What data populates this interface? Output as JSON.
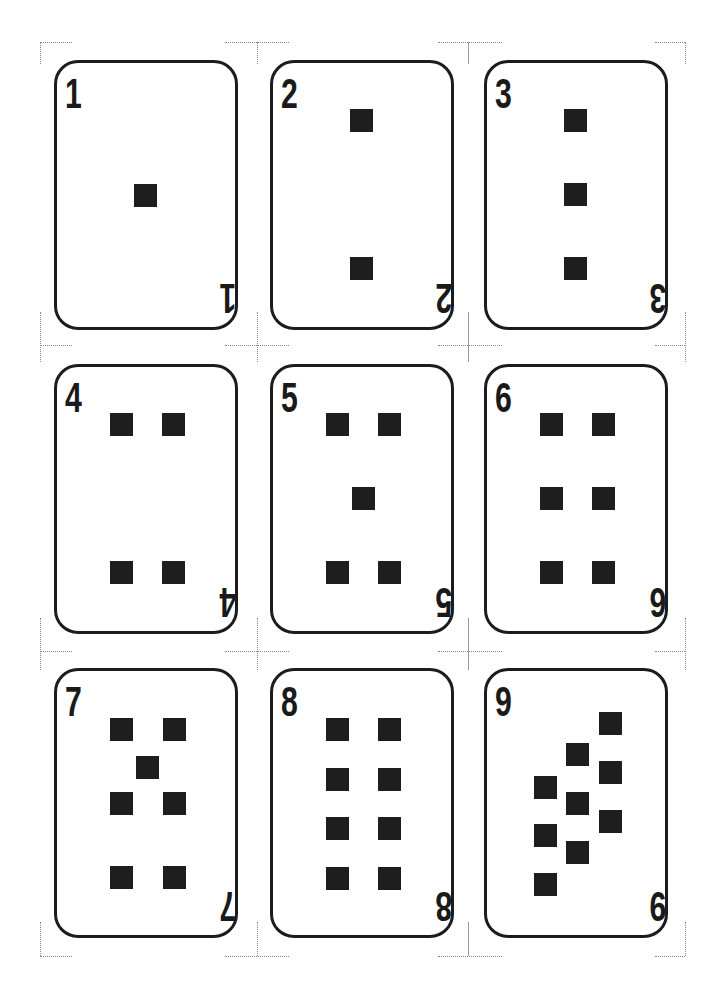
{
  "sheet": {
    "background": "#ffffff",
    "ink_color": "#1e1e1e",
    "pip_shape": "square",
    "layout": {
      "columns": 3,
      "rows": 3
    }
  },
  "cards": [
    {
      "rank": "1",
      "pips": [
        [
          91,
          135
        ]
      ]
    },
    {
      "rank": "2",
      "pips": [
        [
          91,
          60
        ],
        [
          91,
          208
        ]
      ]
    },
    {
      "rank": "3",
      "pips": [
        [
          91,
          60
        ],
        [
          91,
          134
        ],
        [
          91,
          208
        ]
      ]
    },
    {
      "rank": "4",
      "pips": [
        [
          67,
          60
        ],
        [
          119,
          60
        ],
        [
          67,
          208
        ],
        [
          119,
          208
        ]
      ]
    },
    {
      "rank": "5",
      "pips": [
        [
          67,
          60
        ],
        [
          119,
          60
        ],
        [
          93,
          134
        ],
        [
          67,
          208
        ],
        [
          119,
          208
        ]
      ]
    },
    {
      "rank": "6",
      "pips": [
        [
          67,
          60
        ],
        [
          119,
          60
        ],
        [
          67,
          134
        ],
        [
          119,
          134
        ],
        [
          67,
          208
        ],
        [
          119,
          208
        ]
      ]
    },
    {
      "rank": "7",
      "pips": [
        [
          67,
          61
        ],
        [
          120,
          61
        ],
        [
          93,
          99
        ],
        [
          67,
          135
        ],
        [
          120,
          135
        ],
        [
          67,
          209
        ],
        [
          120,
          209
        ]
      ]
    },
    {
      "rank": "8",
      "pips": [
        [
          67,
          61
        ],
        [
          119,
          61
        ],
        [
          67,
          111
        ],
        [
          119,
          111
        ],
        [
          67,
          160
        ],
        [
          119,
          160
        ],
        [
          67,
          210
        ],
        [
          119,
          210
        ]
      ]
    },
    {
      "rank": "9",
      "pips": [
        [
          126,
          55
        ],
        [
          126,
          104
        ],
        [
          126,
          153
        ],
        [
          93,
          86
        ],
        [
          93,
          135
        ],
        [
          93,
          184
        ],
        [
          61,
          119
        ],
        [
          61,
          167
        ],
        [
          61,
          216
        ]
      ]
    }
  ]
}
